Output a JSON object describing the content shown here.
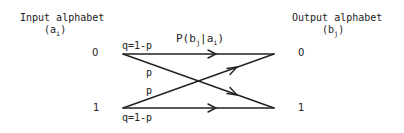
{
  "diagram": {
    "input": {
      "heading": "Input alphabet",
      "var": "(a",
      "var_sub": "i",
      "var_close": ")",
      "symbols": [
        "0",
        "1"
      ]
    },
    "output": {
      "heading": "Output alphabet",
      "var": "(b",
      "var_sub": "j",
      "var_close": ")",
      "symbols": [
        "0",
        "1"
      ]
    },
    "transition_label": {
      "prefix": "P(b",
      "sub1": "j",
      "mid": "|a",
      "sub2": "i",
      "suffix": ")"
    },
    "edges": [
      {
        "from": "0",
        "to": "0",
        "label": "q=1-p"
      },
      {
        "from": "0",
        "to": "1",
        "label": "p"
      },
      {
        "from": "1",
        "to": "0",
        "label": "p"
      },
      {
        "from": "1",
        "to": "1",
        "label": "q=1-p"
      }
    ],
    "colors": {
      "ink": "#222222",
      "background": "#ffffff"
    }
  }
}
